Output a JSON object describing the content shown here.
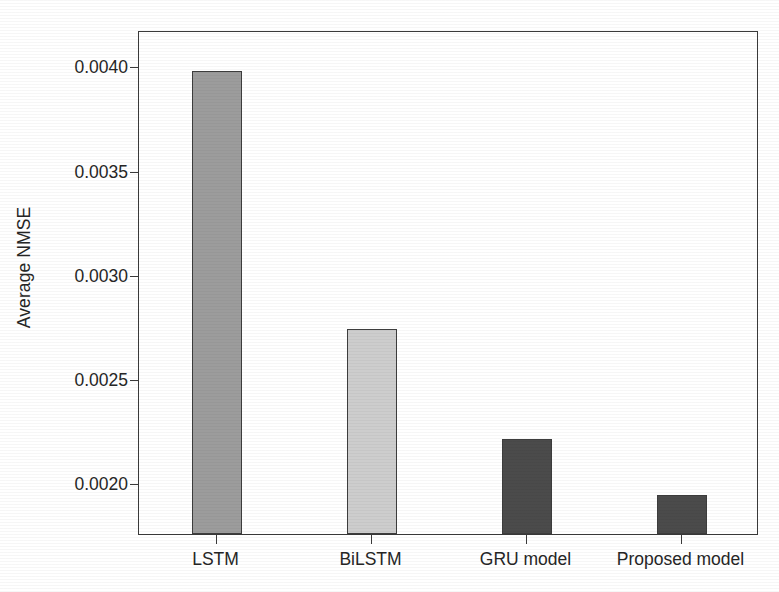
{
  "chart_data": {
    "type": "bar",
    "title": "",
    "xlabel": "",
    "ylabel": "Average NMSE",
    "categories": [
      "LSTM",
      "BiLSTM",
      "GRU model",
      "Proposed model"
    ],
    "values": [
      0.00398,
      0.00274,
      0.00221,
      0.00194
    ],
    "series": [
      {
        "name": "Average NMSE",
        "values": [
          0.00398,
          0.00274,
          0.00221,
          0.00194
        ]
      }
    ],
    "bar_colors": [
      "#9c9c9c",
      "#cdcdcd",
      "#4b4b4b",
      "#4b4b4b"
    ],
    "bar_edge_color": "#3d3d3d",
    "ylim": [
      0.001755,
      0.004175
    ],
    "yticks": [
      0.002,
      0.0025,
      0.003,
      0.0035,
      0.004
    ],
    "ytick_labels": [
      "0.0020",
      "0.0025",
      "0.0030",
      "0.0035",
      "0.0040"
    ],
    "grid": false,
    "legend": false,
    "legend_position": "none",
    "frame": true,
    "axis_color": "#3a3a3a",
    "background": "#ffffff"
  }
}
